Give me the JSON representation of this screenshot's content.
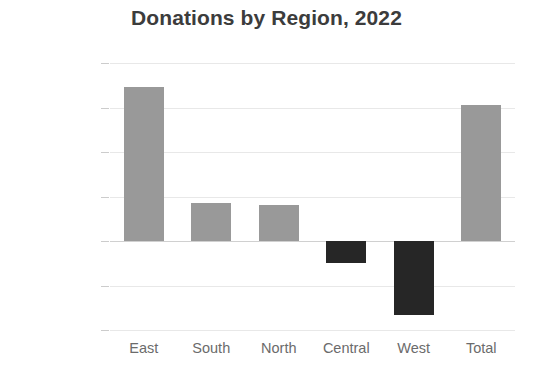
{
  "chart_data": {
    "type": "bar",
    "title": "Donations by Region, 2022",
    "xlabel": "",
    "ylabel": "",
    "categories": [
      "East",
      "South",
      "North",
      "Central",
      "West",
      "Total"
    ],
    "values": [
      34500,
      8500,
      8000,
      -5000,
      -16700,
      30500
    ],
    "series": [
      {
        "name": "Donations",
        "values": [
          34500,
          8500,
          8000,
          -5000,
          -16700,
          30500
        ]
      }
    ],
    "ylim": [
      -20000,
      40000
    ],
    "ytick_values": [
      40000,
      30000,
      20000,
      10000,
      0,
      -10000,
      -20000
    ],
    "ytick_labels": [
      "$40,000",
      "$30,000",
      "$20,000",
      "$10,000",
      "$0",
      "-$10,000",
      "-$20,000"
    ],
    "grid": true,
    "legend": false,
    "legend_position": "none",
    "colors": {
      "positive_bar": "#999999",
      "negative_bar": "#262626",
      "gridline": "#e8e8e8",
      "zero_line": "#d0d0d0",
      "title_text": "#3c3c3c",
      "tick_text": "#6b6b6b",
      "background": "#ffffff"
    },
    "annotations": []
  }
}
